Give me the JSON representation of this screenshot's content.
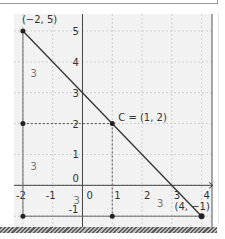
{
  "figure": {
    "background": "#f2f2f2",
    "grid_color": "#c8c8c8",
    "axis_color": "#444444",
    "line_color": "#333333",
    "label_color": "#333333",
    "side_label_color": "#777777",
    "xlim": [
      -2.3,
      4.35
    ],
    "ylim": [
      -1.35,
      5.55
    ],
    "x_ticks": [
      -2,
      -1,
      0,
      1,
      2,
      3,
      4
    ],
    "y_ticks": [
      -1,
      0,
      1,
      2,
      3,
      4,
      5
    ],
    "x_tick_labels": [
      "-2",
      "-1",
      "0",
      "1",
      "2",
      "3",
      "4"
    ],
    "y_tick_labels": [
      "-1",
      "0",
      "1",
      "2",
      "3",
      "4",
      "5"
    ]
  },
  "points": [
    {
      "name": "A",
      "x": -2,
      "y": 5,
      "label": "(−2, 5)"
    },
    {
      "name": "C",
      "x": 1,
      "y": 2,
      "label": "C = (1, 2)"
    },
    {
      "name": "B",
      "x": 4,
      "y": -1,
      "label": "(4, −1)"
    },
    {
      "name": "P1",
      "x": -2,
      "y": 2,
      "label": ""
    },
    {
      "name": "P2",
      "x": -2,
      "y": -1,
      "label": ""
    },
    {
      "name": "P3",
      "x": 1,
      "y": -1,
      "label": ""
    }
  ],
  "segments": {
    "main_line": {
      "from": [
        -2,
        5
      ],
      "to": [
        4,
        -1
      ]
    },
    "left_side": {
      "from": [
        -2,
        5
      ],
      "to": [
        -2,
        -1
      ]
    },
    "bottom_side": {
      "from": [
        -2,
        -1
      ],
      "to": [
        4,
        -1
      ]
    },
    "dashed_h": {
      "from": [
        -2,
        2
      ],
      "to": [
        1,
        2
      ]
    },
    "dashed_v": {
      "from": [
        1,
        2
      ],
      "to": [
        1,
        -1
      ]
    }
  },
  "side_labels": [
    {
      "text": "3",
      "x": -1.75,
      "y": 3.5
    },
    {
      "text": "3",
      "x": -1.75,
      "y": 0.5
    },
    {
      "text": "3",
      "x": -0.3,
      "y": -0.6
    },
    {
      "text": "3",
      "x": 2.5,
      "y": -0.7
    }
  ],
  "chart_data": {
    "type": "line",
    "title": "",
    "xlabel": "",
    "ylabel": "",
    "xlim": [
      -2,
      4
    ],
    "ylim": [
      -1,
      5
    ],
    "grid": true,
    "series": [
      {
        "name": "line through (-2,5) and (4,-1)",
        "x": [
          -2,
          1,
          4
        ],
        "y": [
          5,
          2,
          -1
        ]
      }
    ],
    "annotations": [
      "(−2, 5)",
      "C = (1, 2)",
      "(4, −1)",
      "3",
      "3",
      "3",
      "3"
    ]
  }
}
